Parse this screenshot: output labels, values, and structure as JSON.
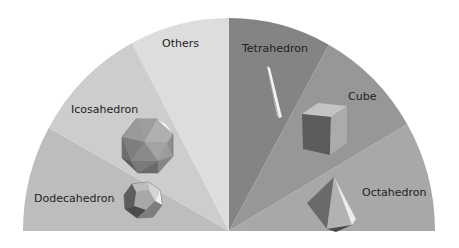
{
  "chart_data": {
    "type": "pie",
    "variant": "half-donut-semicircle",
    "title": "",
    "start_angle_deg": 180,
    "end_angle_deg": 360,
    "order": "clockwise from left",
    "categories": [
      "Dodecahedron",
      "Icosahedron",
      "Others",
      "Tetrahedron",
      "Cube",
      "Octahedron"
    ],
    "values": [
      16.1,
      18.3,
      15.6,
      16.1,
      17.2,
      16.7
    ],
    "slice_angles_deg": [
      29,
      33,
      28,
      29,
      31,
      30
    ],
    "colors": [
      "#bdbdbd",
      "#cdcdcd",
      "#dddddd",
      "#848484",
      "#979797",
      "#a8a8a8"
    ],
    "images": [
      "dodecahedron",
      "icosahedron",
      null,
      "tetrahedron",
      "cube",
      "octahedron"
    ],
    "legend": "none (inline labels)"
  },
  "labels": {
    "dodecahedron": "Dodecahedron",
    "icosahedron": "Icosahedron",
    "others": "Others",
    "tetrahedron": "Tetrahedron",
    "cube": "Cube",
    "octahedron": "Octahedron"
  }
}
